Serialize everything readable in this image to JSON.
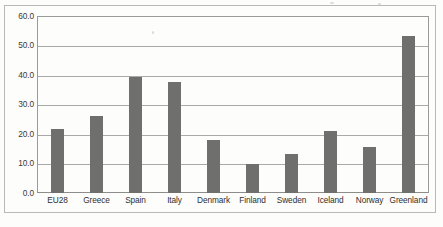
{
  "chart_data": {
    "type": "bar",
    "title": "",
    "subtitle": "",
    "xlabel": "",
    "ylabel": "",
    "categories": [
      "EU28",
      "Greece",
      "Spain",
      "Italy",
      "Denmark",
      "Finland",
      "Sweden",
      "Iceland",
      "Norway",
      "Greenland"
    ],
    "values": [
      21.7,
      26.1,
      39.7,
      37.7,
      18.2,
      10.0,
      13.3,
      21.0,
      15.8,
      53.5
    ],
    "ylim": [
      0.0,
      60.0
    ],
    "ytick_labels": [
      "60.0",
      "50.0",
      "40.0",
      "30.0",
      "20.0",
      "10.0",
      "0.0"
    ],
    "ytick_values": [
      60.0,
      50.0,
      40.0,
      30.0,
      20.0,
      10.0,
      0.0
    ],
    "grid": true,
    "legend": "none",
    "series_color": "#6f6f6d",
    "gridline_color": "#a9a9a7",
    "axis_color": "#9a9a98",
    "background_color": "#fdfdfc"
  }
}
